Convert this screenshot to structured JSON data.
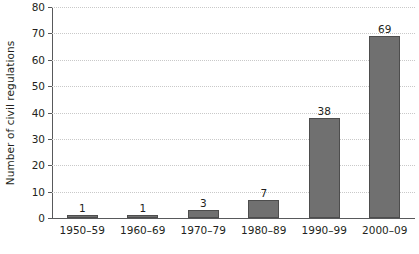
{
  "chart_data": {
    "type": "bar",
    "title": "",
    "xlabel": "",
    "ylabel": "Number of civil regulations",
    "categories": [
      "1950–59",
      "1960–69",
      "1970–79",
      "1980–89",
      "1990–99",
      "2000–09"
    ],
    "values": [
      1,
      1,
      3,
      7,
      38,
      69
    ],
    "value_labels": [
      "1",
      "1",
      "3",
      "7",
      "38",
      "69"
    ],
    "ylim": [
      0,
      80
    ],
    "yticks": [
      0,
      10,
      20,
      30,
      40,
      50,
      60,
      70,
      80
    ],
    "ytick_labels": [
      "0",
      "10",
      "20",
      "30",
      "40",
      "50",
      "60",
      "70",
      "80"
    ],
    "grid": true,
    "grid_axis": "y",
    "legend": false,
    "legend_position": "none",
    "series": [
      {
        "name": "Number of civil regulations",
        "values": [
          1,
          1,
          3,
          7,
          38,
          69
        ]
      }
    ],
    "colors": {
      "bar_fill": "#707070",
      "bar_border": "#4d4d4d",
      "gridline": "#c9c9c9",
      "axis": "#58595b",
      "text": "#231f20",
      "background": "#ffffff"
    }
  }
}
